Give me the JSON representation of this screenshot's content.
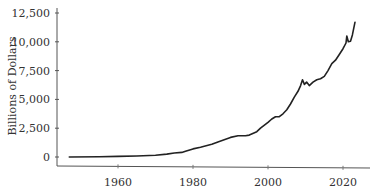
{
  "chart_data": {
    "type": "line",
    "title": "",
    "xlabel": "",
    "ylabel": "Billions of Dollars",
    "xlim": [
      1947,
      2023
    ],
    "ylim": [
      0,
      12500
    ],
    "x_ticks": [
      1960,
      1980,
      2000,
      2020
    ],
    "x_tick_labels": [
      "1960",
      "1980",
      "2000",
      "2020"
    ],
    "y_ticks": [
      0,
      2500,
      5000,
      7500,
      10000,
      12500
    ],
    "y_tick_labels": [
      "0",
      "2,500",
      "5,000",
      "7,500",
      "10,000",
      "12,500"
    ],
    "grid": false,
    "legend": null,
    "series": [
      {
        "name": "Series",
        "color": "#222222",
        "x": [
          1947,
          1955,
          1960,
          1965,
          1970,
          1973,
          1975,
          1977,
          1978,
          1980,
          1982,
          1985,
          1987,
          1990,
          1992,
          1994,
          1995,
          1997,
          1998,
          2000,
          2001,
          2002,
          2003,
          2004,
          2005,
          2006,
          2007,
          2008,
          2008.7,
          2009.2,
          2009.7,
          2010.3,
          2011,
          2012,
          2013,
          2014,
          2015,
          2016,
          2017,
          2018,
          2019,
          2020,
          2020.8,
          2021,
          2021.4,
          2022,
          2022.5,
          2023.2
        ],
        "values": [
          0,
          20,
          50,
          90,
          150,
          250,
          350,
          400,
          500,
          700,
          850,
          1100,
          1350,
          1700,
          1850,
          1850,
          1900,
          2200,
          2500,
          3000,
          3300,
          3500,
          3500,
          3750,
          4100,
          4600,
          5200,
          5700,
          6200,
          6700,
          6300,
          6500,
          6200,
          6500,
          6700,
          6800,
          7000,
          7500,
          8100,
          8400,
          8900,
          9400,
          9900,
          10500,
          10000,
          10050,
          10600,
          11700
        ]
      }
    ]
  },
  "axes": {
    "ylabel": "Billions of Dollars",
    "y_labels": [
      "12,500",
      "10,000",
      "7,500",
      "5,000",
      "2,500",
      "0"
    ],
    "x_labels": [
      "1960",
      "1980",
      "2000",
      "2020"
    ]
  }
}
